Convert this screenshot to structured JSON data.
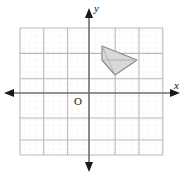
{
  "figure": {
    "background_color": "#ffffff"
  },
  "axes": {
    "x_label": "x",
    "y_label": "y",
    "origin_label": "O",
    "axis_color": "#6e6e6e",
    "arrow_color": "#1a1a1a",
    "x_axis_y_px": 93,
    "y_axis_x_px": 89,
    "x_axis_start_px": 8,
    "x_axis_end_px": 178,
    "y_axis_start_px": 10,
    "y_axis_end_px": 170,
    "arrows": [
      "left",
      "right",
      "up",
      "down"
    ]
  },
  "grid": {
    "major_color": "#b9b9b9",
    "minor_color": "#cfcfcf",
    "minor_style": "dotted",
    "left_px": 20,
    "top_px": 28,
    "right_px": 163,
    "bottom_px": 155,
    "major_spacing_px": 23.8,
    "minor_per_major": 4,
    "columns": 6,
    "rows": 5,
    "x_major_lines_px": [
      20,
      43.8,
      67.6,
      91.4,
      115.2,
      139,
      162.8
    ],
    "y_major_lines_px": [
      28,
      53.4,
      78.8,
      104.2,
      129.6,
      155
    ]
  },
  "shape": {
    "name": "shaded-quadrilateral",
    "fill_color": "#d9d9d9",
    "stroke_color": "#8a8a8a",
    "fill_opacity": 0.95,
    "vertices_px": [
      {
        "x": 102,
        "y": 46
      },
      {
        "x": 137,
        "y": 60
      },
      {
        "x": 115,
        "y": 75
      },
      {
        "x": 102,
        "y": 60
      }
    ],
    "points_attr": "102,46 137,60 115,75 102,60"
  },
  "shape_accents": {
    "inner_line_color": "#a8a8a8",
    "segments_px": [
      {
        "x1": 102,
        "y1": 46,
        "x2": 115,
        "y2": 75
      },
      {
        "x1": 102,
        "y1": 60,
        "x2": 137,
        "y2": 60
      }
    ]
  }
}
